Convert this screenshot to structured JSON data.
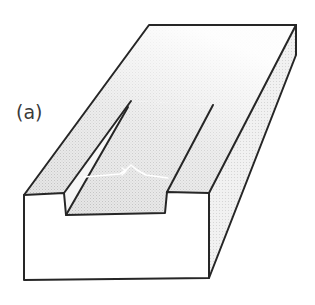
{
  "figure": {
    "label": "(a)",
    "colors": {
      "outline": "#262626",
      "shaded_surface": "#d9d9d9",
      "side_face": "#eeeeee",
      "front_face": "#ffffff",
      "arrow": "#ffffff"
    }
  }
}
